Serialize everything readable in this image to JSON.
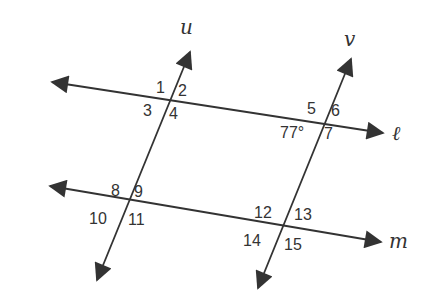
{
  "diagram": {
    "colors": {
      "line": "#333333",
      "text": "#333333",
      "background": "#ffffff"
    },
    "lines": {
      "l": {
        "label": "ℓ"
      },
      "m": {
        "label": "m"
      },
      "u": {
        "label": "u"
      },
      "v": {
        "label": "v"
      }
    },
    "angles": {
      "a1": "1",
      "a2": "2",
      "a3": "3",
      "a4": "4",
      "a5": "5",
      "a6": "6",
      "a7": "7",
      "given": "77°",
      "a8": "8",
      "a9": "9",
      "a10": "10",
      "a11": "11",
      "a12": "12",
      "a13": "13",
      "a14": "14",
      "a15": "15"
    }
  }
}
